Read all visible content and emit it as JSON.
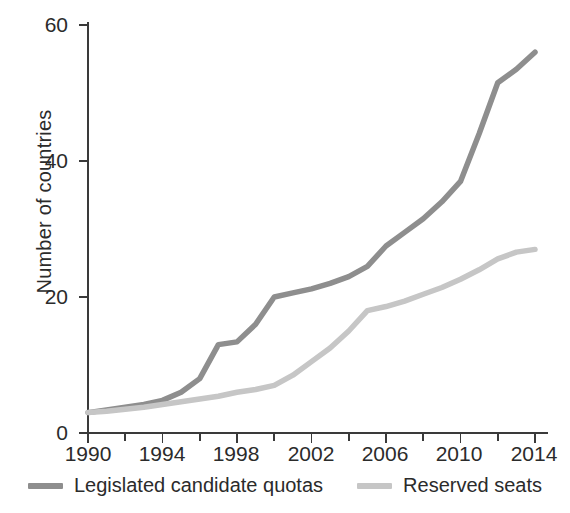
{
  "chart_data": {
    "type": "line",
    "title": "",
    "xlabel": "",
    "ylabel": "Number of countries",
    "xlim": [
      1990,
      2014
    ],
    "ylim": [
      0,
      60
    ],
    "grid": false,
    "legend_position": "bottom",
    "y_ticks": [
      0,
      20,
      40,
      60
    ],
    "y_tick_labels": [
      "0",
      "20",
      "40",
      "60"
    ],
    "x_ticks": [
      1990,
      1992,
      1994,
      1996,
      1998,
      2000,
      2002,
      2004,
      2006,
      2008,
      2010,
      2012,
      2014
    ],
    "x_tick_labels_major": [
      "1990",
      "1994",
      "1998",
      "2002",
      "2006",
      "2010",
      "2014"
    ],
    "x_major_years": [
      1990,
      1994,
      1998,
      2002,
      2006,
      2010,
      2014
    ],
    "x": [
      1990,
      1991,
      1992,
      1993,
      1994,
      1995,
      1996,
      1997,
      1998,
      1999,
      2000,
      2001,
      2002,
      2003,
      2004,
      2005,
      2006,
      2007,
      2008,
      2009,
      2010,
      2011,
      2012,
      2013,
      2014
    ],
    "series": [
      {
        "name": "Legislated candidate quotas",
        "color": "#8e8e8e",
        "values": [
          3,
          3.4,
          3.8,
          4.2,
          4.8,
          6,
          8,
          13,
          13.4,
          16,
          20,
          20.6,
          21.2,
          22,
          23,
          24.5,
          27.5,
          29.5,
          31.5,
          34,
          37,
          44,
          51.5,
          53.5,
          56
        ]
      },
      {
        "name": "Reserved seats",
        "color": "#c6c6c6",
        "values": [
          3,
          3.2,
          3.5,
          3.8,
          4.2,
          4.6,
          5,
          5.4,
          6,
          6.4,
          7,
          8.5,
          10.5,
          12.5,
          15,
          18,
          18.6,
          19.4,
          20.4,
          21.4,
          22.6,
          24,
          25.6,
          26.6,
          27
        ]
      }
    ],
    "legend": [
      {
        "label": "Legislated candidate quotas",
        "color": "#8e8e8e",
        "swatch": "line-swatch"
      },
      {
        "label": "Reserved seats",
        "color": "#c6c6c6",
        "swatch": "line-swatch"
      }
    ]
  }
}
